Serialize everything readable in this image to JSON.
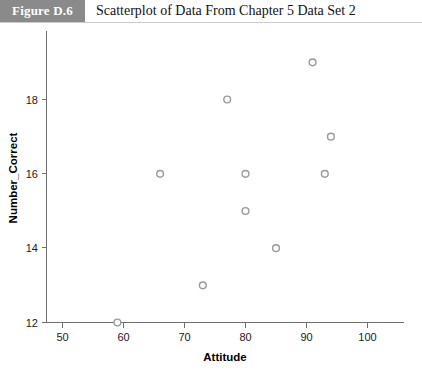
{
  "header": {
    "badge_label": "Figure D.6",
    "title": "Scatterplot of Data From Chapter 5 Data Set 2"
  },
  "colors": {
    "badge_background": "#8a8a8a",
    "badge_text": "#ffffff",
    "title_text": "#111111",
    "axis": "#6f6f6f",
    "marker_stroke": "#9a9a9a",
    "marker_fill": "#fbfbfb",
    "plot_background": "#ffffff"
  },
  "chart_data": {
    "type": "scatter",
    "title": "Scatterplot of Data From Chapter 5 Data Set 2",
    "xlabel": "Attitude",
    "ylabel": "Number_Correct",
    "xlim": [
      46,
      103
    ],
    "ylim": [
      12,
      19.6
    ],
    "xticks": [
      50,
      60,
      70,
      80,
      90,
      100
    ],
    "xticklabels": [
      "50",
      "60",
      "70",
      "80",
      "90",
      "100"
    ],
    "yticks": [
      12,
      14,
      16,
      18
    ],
    "yticklabels": [
      "12",
      "14",
      "16",
      "18"
    ],
    "grid": false,
    "legend": false,
    "n_points": 10,
    "x": [
      59,
      66,
      73,
      77,
      80,
      80,
      85,
      91,
      93,
      94
    ],
    "y": [
      12,
      16,
      13,
      18,
      16,
      15,
      14,
      19,
      16,
      17
    ],
    "points": [
      {
        "x": 59,
        "y": 12
      },
      {
        "x": 66,
        "y": 16
      },
      {
        "x": 73,
        "y": 13
      },
      {
        "x": 77,
        "y": 18
      },
      {
        "x": 80,
        "y": 16
      },
      {
        "x": 80,
        "y": 15
      },
      {
        "x": 85,
        "y": 14
      },
      {
        "x": 91,
        "y": 19
      },
      {
        "x": 93,
        "y": 16
      },
      {
        "x": 94,
        "y": 17
      }
    ]
  }
}
